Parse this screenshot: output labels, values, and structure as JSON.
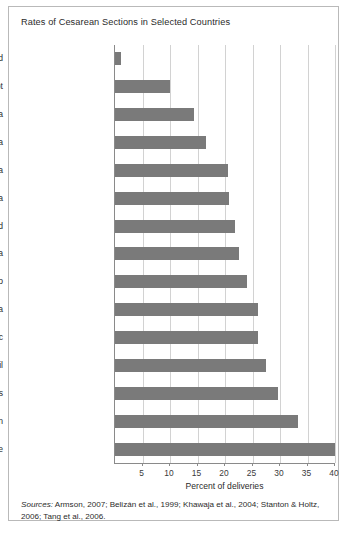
{
  "chart_data": {
    "type": "bar",
    "orientation": "horizontal",
    "title": "Rates of Cesarean Sections in Selected Countries",
    "xlabel": "Percent of deliveries",
    "ylabel": "",
    "xlim": [
      0,
      40
    ],
    "xticks": [
      5,
      10,
      15,
      20,
      25,
      30,
      35,
      40
    ],
    "grid": true,
    "legend": "none",
    "categories": [
      "Chad",
      "Egypt",
      "Syria",
      "Colombia",
      "Costa Rica",
      "Venezuela",
      "England",
      "Canada",
      "Mexico",
      "China",
      "Dominican Republic",
      "Brazil",
      "United States",
      "Taiwan",
      "Chile"
    ],
    "values": [
      1,
      10,
      14.4,
      16.5,
      20.5,
      20.7,
      21.8,
      22.5,
      24,
      26,
      26,
      27.5,
      29.6,
      33.2,
      40
    ],
    "bar_color": "#7a7a7a",
    "grid_color": "#d2d2d2",
    "axis_color": "#8a8a8a"
  },
  "sources": {
    "label": "Sources:",
    "text": " Armson, 2007; Belizán et al., 1999; Khawaja et al., 2004; Stanton & Holtz, 2006; Tang et al., 2006."
  }
}
